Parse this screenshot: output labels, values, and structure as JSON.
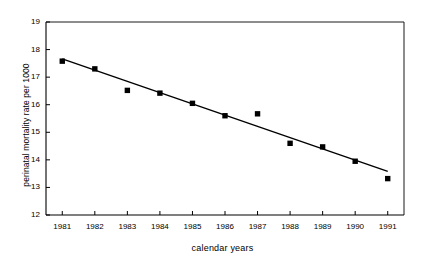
{
  "chart_data": {
    "type": "scatter",
    "title": "",
    "xlabel": "calendar years",
    "ylabel": "perinatal mortality rate per 1000",
    "categories": [
      "1981",
      "1982",
      "1983",
      "1984",
      "1985",
      "1986",
      "1987",
      "1988",
      "1989",
      "1990",
      "1991"
    ],
    "x": [
      1981,
      1982,
      1983,
      1984,
      1985,
      1986,
      1987,
      1988,
      1989,
      1990,
      1991
    ],
    "values": [
      17.58,
      17.3,
      16.52,
      16.42,
      16.05,
      15.6,
      15.67,
      14.6,
      14.47,
      13.95,
      13.32
    ],
    "series": [
      {
        "name": "perinatal mortality rate",
        "marker": "filled-square",
        "color": "#000000",
        "values": [
          17.58,
          17.3,
          16.52,
          16.42,
          16.05,
          15.6,
          15.67,
          14.6,
          14.47,
          13.95,
          13.32
        ]
      },
      {
        "name": "linear trend line",
        "type": "line",
        "color": "#000000",
        "endpoints": [
          {
            "x": 1981,
            "y": 17.66
          },
          {
            "x": 1991,
            "y": 13.58
          }
        ]
      }
    ],
    "ylim": [
      12,
      19
    ],
    "yticks": [
      12,
      13,
      14,
      15,
      16,
      17,
      18,
      19
    ],
    "ytick_labels": [
      "12",
      "13",
      "14",
      "15",
      "16",
      "17",
      "18",
      "19"
    ],
    "xlim": [
      1980.5,
      1991.5
    ],
    "grid": false,
    "legend": null,
    "legend_position": "none",
    "axis_color": "#000000",
    "plot_background": "#ffffff"
  }
}
